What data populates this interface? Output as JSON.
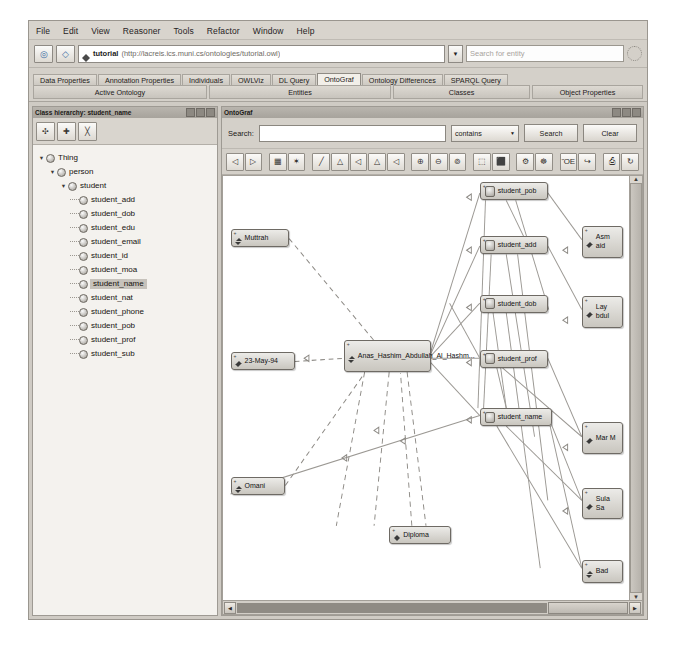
{
  "window": {
    "menu": [
      "File",
      "Edit",
      "View",
      "Reasoner",
      "Tools",
      "Refactor",
      "Window",
      "Help"
    ]
  },
  "addressbar": {
    "back_icon": "back-arrow-icon",
    "forward_icon": "forward-arrow-icon",
    "ontology_title": "tutorial",
    "ontology_uri": "(http://lacreis.ics.muni.cs/ontologies/tutorial.owl)",
    "dropdown_icon": "chevron-down-icon",
    "entity_search_placeholder": "Search for entity",
    "spinner_icon": "progress-spinner-icon"
  },
  "tabs": {
    "items": [
      {
        "label": "Data Properties",
        "selected": false
      },
      {
        "label": "Annotation Properties",
        "selected": false
      },
      {
        "label": "Individuals",
        "selected": false
      },
      {
        "label": "OWLViz",
        "selected": false
      },
      {
        "label": "DL Query",
        "selected": false
      },
      {
        "label": "OntoGraf",
        "selected": true
      },
      {
        "label": "Ontology Differences",
        "selected": false
      },
      {
        "label": "SPARQL Query",
        "selected": false
      }
    ],
    "groups": [
      "Active Ontology",
      "Entities",
      "Classes",
      "Object Properties"
    ]
  },
  "class_hierarchy": {
    "title": "Class hierarchy: student_name",
    "tools": [
      {
        "name": "add-subclass-button",
        "glyph": "➕"
      },
      {
        "name": "add-sibling-class-button",
        "glyph": "❖"
      },
      {
        "name": "delete-class-button",
        "glyph": "✖"
      }
    ],
    "tree": [
      {
        "label": "Thing",
        "depth": 0,
        "expanded": true,
        "selected": false
      },
      {
        "label": "person",
        "depth": 1,
        "expanded": true,
        "selected": false
      },
      {
        "label": "student",
        "depth": 2,
        "expanded": true,
        "selected": false
      },
      {
        "label": "student_add",
        "depth": 3,
        "expanded": false,
        "selected": false
      },
      {
        "label": "student_dob",
        "depth": 3,
        "expanded": false,
        "selected": false
      },
      {
        "label": "student_edu",
        "depth": 3,
        "expanded": false,
        "selected": false
      },
      {
        "label": "student_email",
        "depth": 3,
        "expanded": false,
        "selected": false
      },
      {
        "label": "student_id",
        "depth": 3,
        "expanded": false,
        "selected": false
      },
      {
        "label": "student_moa",
        "depth": 3,
        "expanded": false,
        "selected": false
      },
      {
        "label": "student_name",
        "depth": 3,
        "expanded": false,
        "selected": true
      },
      {
        "label": "student_nat",
        "depth": 3,
        "expanded": false,
        "selected": false
      },
      {
        "label": "student_phone",
        "depth": 3,
        "expanded": false,
        "selected": false
      },
      {
        "label": "student_pob",
        "depth": 3,
        "expanded": false,
        "selected": false
      },
      {
        "label": "student_prof",
        "depth": 3,
        "expanded": false,
        "selected": false
      },
      {
        "label": "student_sub",
        "depth": 3,
        "expanded": false,
        "selected": false
      }
    ]
  },
  "ontograf": {
    "title": "OntoGraf",
    "search_label": "Search:",
    "search_value": "",
    "match_mode": "contains",
    "search_button": "Search",
    "clear_button": "Clear",
    "toolbar": [
      {
        "name": "navigate-back-icon",
        "glyph": "◁"
      },
      {
        "name": "navigate-forward-icon",
        "glyph": "▷"
      },
      {
        "name": "grid-layout-icon",
        "glyph": "▦"
      },
      {
        "name": "radial-layout-icon",
        "glyph": "✶"
      },
      {
        "name": "spring-layout-icon",
        "glyph": "╱"
      },
      {
        "name": "tree-layout-down-icon",
        "glyph": "△"
      },
      {
        "name": "tree-layout-left-icon",
        "glyph": "◁"
      },
      {
        "name": "tree-layout-up-icon",
        "glyph": "△"
      },
      {
        "name": "tree-layout-right-icon",
        "glyph": "◁"
      },
      {
        "name": "zoom-in-icon",
        "glyph": "⊕"
      },
      {
        "name": "zoom-out-icon",
        "glyph": "⊖"
      },
      {
        "name": "zoom-fit-icon",
        "glyph": "⊚"
      },
      {
        "name": "expand-node-icon",
        "glyph": "⬚"
      },
      {
        "name": "collapse-node-icon",
        "glyph": "⬛"
      },
      {
        "name": "filter-icon",
        "glyph": "⚙"
      },
      {
        "name": "settings-icon",
        "glyph": "☸"
      },
      {
        "name": "save-image-icon",
        "glyph": "ὋE"
      },
      {
        "name": "export-icon",
        "glyph": "↪"
      },
      {
        "name": "print-icon",
        "glyph": "⎙"
      },
      {
        "name": "refresh-icon",
        "glyph": "↻"
      }
    ],
    "scroll": {
      "left_arrow": "◀",
      "right_arrow": "▶",
      "up_arrow": "▲",
      "down_arrow": "▼",
      "thumb_label": ""
    },
    "graph": {
      "nodes": [
        {
          "label": "Muttrah",
          "kind": "individual",
          "x": 8,
          "y": 50,
          "w": 62,
          "h": 17,
          "clipped": false
        },
        {
          "label": "23-May-94",
          "kind": "individual",
          "x": 8,
          "y": 166,
          "w": 68,
          "h": 17,
          "clipped": false
        },
        {
          "label": "Omani",
          "kind": "individual",
          "x": 8,
          "y": 284,
          "w": 58,
          "h": 17,
          "clipped": false
        },
        {
          "label": "Diploma",
          "kind": "individual",
          "x": 176,
          "y": 330,
          "w": 66,
          "h": 17,
          "clipped": false
        },
        {
          "label": "Anas_Hashim_Abdullah_Al_Hashm...",
          "kind": "individual",
          "x": 128,
          "y": 155,
          "w": 92,
          "h": 30,
          "clipped": false
        },
        {
          "label": "student_pob",
          "kind": "class",
          "x": 272,
          "y": 6,
          "w": 72,
          "h": 17,
          "clipped": false
        },
        {
          "label": "student_add",
          "kind": "class",
          "x": 272,
          "y": 57,
          "w": 72,
          "h": 17,
          "clipped": false
        },
        {
          "label": "student_dob",
          "kind": "class",
          "x": 272,
          "y": 112,
          "w": 72,
          "h": 17,
          "clipped": false
        },
        {
          "label": "student_prof",
          "kind": "class",
          "x": 272,
          "y": 164,
          "w": 72,
          "h": 17,
          "clipped": false
        },
        {
          "label": "student_name",
          "kind": "class",
          "x": 272,
          "y": 219,
          "w": 76,
          "h": 17,
          "clipped": false
        },
        {
          "label": "Asm aid",
          "kind": "individual",
          "x": 380,
          "y": 47,
          "w": 44,
          "h": 30,
          "clipped": true
        },
        {
          "label": "Lay bdul",
          "kind": "individual",
          "x": 380,
          "y": 113,
          "w": 44,
          "h": 30,
          "clipped": true
        },
        {
          "label": "Mar M",
          "kind": "individual",
          "x": 380,
          "y": 232,
          "w": 44,
          "h": 30,
          "clipped": true
        },
        {
          "label": "Sula Sa",
          "kind": "individual",
          "x": 380,
          "y": 294,
          "w": 44,
          "h": 30,
          "clipped": true
        },
        {
          "label": "Bad",
          "kind": "individual",
          "x": 380,
          "y": 362,
          "w": 44,
          "h": 22,
          "clipped": true
        }
      ]
    }
  }
}
